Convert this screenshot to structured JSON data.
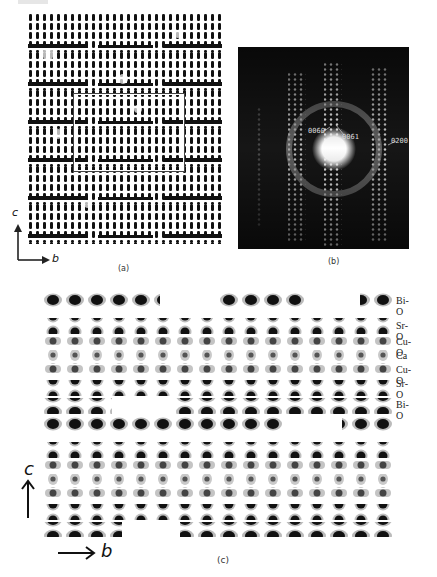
{
  "figure": {
    "panel_a": {
      "label": "(a)",
      "axes": {
        "vertical": "c",
        "horizontal": "b"
      },
      "content": "HRTEM lattice image with highlighted rectangular region"
    },
    "panel_b": {
      "label": "(b)",
      "content": "electron diffraction pattern",
      "spot_labels": [
        "0060",
        "0061",
        "0200"
      ]
    },
    "panel_c": {
      "label": "(c)",
      "axes": {
        "vertical": "c",
        "horizontal": "b"
      },
      "layer_labels": [
        "Bi-O",
        "Sr-O",
        "Cu-O",
        "Ca",
        "Cu-O",
        "Sr-O",
        "Bi-O"
      ]
    }
  }
}
